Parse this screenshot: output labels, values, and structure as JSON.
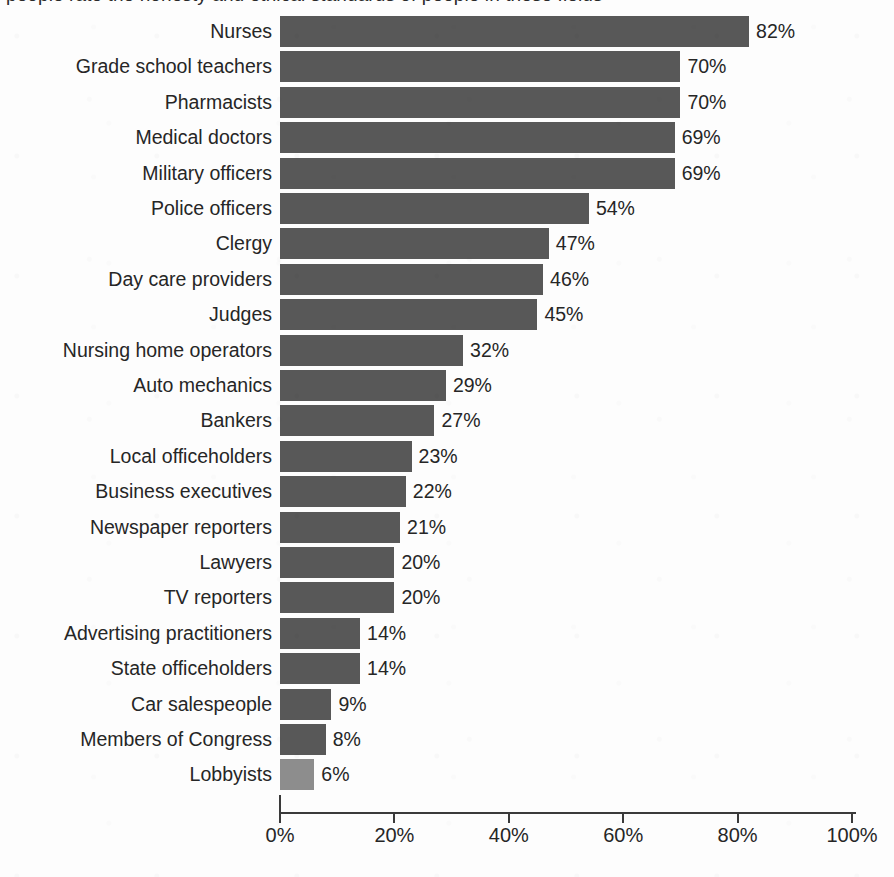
{
  "title": {
    "text": "people rate the honesty and ethical standards of people in these fields",
    "visible_note": "clipped at top edge of scan"
  },
  "chart_data": {
    "type": "bar",
    "orientation": "horizontal",
    "title": "",
    "xlabel": "",
    "ylabel": "",
    "xlim": [
      0,
      100
    ],
    "xticks": [
      "0%",
      "20%",
      "40%",
      "60%",
      "80%",
      "100%"
    ],
    "xtick_values": [
      0,
      20,
      40,
      60,
      80,
      100
    ],
    "grid": false,
    "legend": "none",
    "value_suffix": "%",
    "bar_color": "#585858",
    "highlight_color": "#8d8d8d",
    "highlight_category": "Lobbyists",
    "categories": [
      "Nurses",
      "Grade school teachers",
      "Pharmacists",
      "Medical doctors",
      "Military officers",
      "Police officers",
      "Clergy",
      "Day care providers",
      "Judges",
      "Nursing home operators",
      "Auto mechanics",
      "Bankers",
      "Local officeholders",
      "Business executives",
      "Newspaper reporters",
      "Lawyers",
      "TV reporters",
      "Advertising practitioners",
      "State officeholders",
      "Car salespeople",
      "Members of Congress",
      "Lobbyists"
    ],
    "values": [
      82,
      70,
      70,
      69,
      69,
      54,
      47,
      46,
      45,
      32,
      29,
      27,
      23,
      22,
      21,
      20,
      20,
      14,
      14,
      9,
      8,
      6
    ],
    "value_labels": [
      "82%",
      "70%",
      "70%",
      "69%",
      "69%",
      "54%",
      "47%",
      "46%",
      "45%",
      "32%",
      "29%",
      "27%",
      "23%",
      "22%",
      "21%",
      "20%",
      "20%",
      "14%",
      "14%",
      "9%",
      "8%",
      "6%"
    ]
  }
}
